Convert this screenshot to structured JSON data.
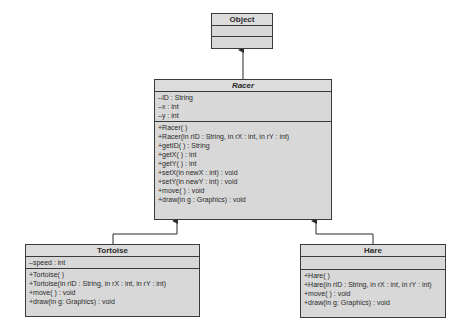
{
  "classes": {
    "object": {
      "name": "Object",
      "attributes": [],
      "methods": []
    },
    "racer": {
      "name": "Racer",
      "abstract": true,
      "attributes": [
        "–ID : String",
        "–x : int",
        "–y : int"
      ],
      "methods": [
        "+Racer( )",
        "+Racer(in rID : String, in rX : int, in rY : int)",
        "+getID( ) : String",
        "+getX( ) : int",
        "+getY( ) : int",
        "+setX(in newX : int) : void",
        "+setY(in newY : int) : void",
        "+move( ) : void",
        "+draw(in g : Graphics) : void"
      ]
    },
    "tortoise": {
      "name": "Tortoise",
      "attributes": [
        "–speed : int"
      ],
      "methods": [
        "+Tortoise( )",
        "+Tortoise(in rID : String, in rX : int, in rY : int)",
        "+move( ) : void",
        "+draw(in g: Graphics) : void"
      ]
    },
    "hare": {
      "name": "Hare",
      "attributes": [],
      "methods": [
        "+Hare( )",
        "+Hare(in rID : String, in rX : int, in rY : int)",
        "+move( ) : void",
        "+draw(in g: Graphics) : void"
      ]
    }
  },
  "relationships": [
    {
      "from": "Racer",
      "to": "Object",
      "type": "generalization"
    },
    {
      "from": "Tortoise",
      "to": "Racer",
      "type": "generalization"
    },
    {
      "from": "Hare",
      "to": "Racer",
      "type": "generalization"
    }
  ],
  "colors": {
    "box_fill": "#d8d8d8",
    "border": "#3a3a3a",
    "line": "#2a2a2a"
  }
}
